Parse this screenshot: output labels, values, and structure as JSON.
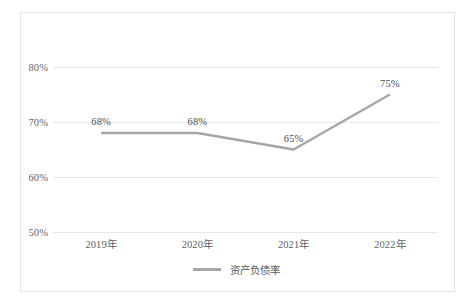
{
  "chart_data": {
    "type": "line",
    "title": "",
    "subtitle": "",
    "xlabel": "",
    "ylabel": "",
    "categories": [
      "2019年",
      "2020年",
      "2021年",
      "2022年"
    ],
    "series": [
      {
        "name": "资产负债率",
        "values": [
          68,
          68,
          65,
          75
        ],
        "color": "#a6a6a6",
        "point_labels": [
          "68%",
          "68%",
          "65%",
          "75%"
        ]
      }
    ],
    "ylim": [
      50,
      80
    ],
    "ytick_values": [
      80,
      70,
      60,
      50
    ],
    "ytick_labels": [
      "80%",
      "70%",
      "60%",
      "50%"
    ],
    "grid": true,
    "legend_position": "bottom",
    "legend_entries": [
      "资产负债率"
    ],
    "colors": {
      "line": "#a6a6a6",
      "gridline": "#e8e8e8",
      "frame": "#e3e3e3",
      "axis_text": "#636363",
      "label_text": "#4d4d4d"
    }
  }
}
